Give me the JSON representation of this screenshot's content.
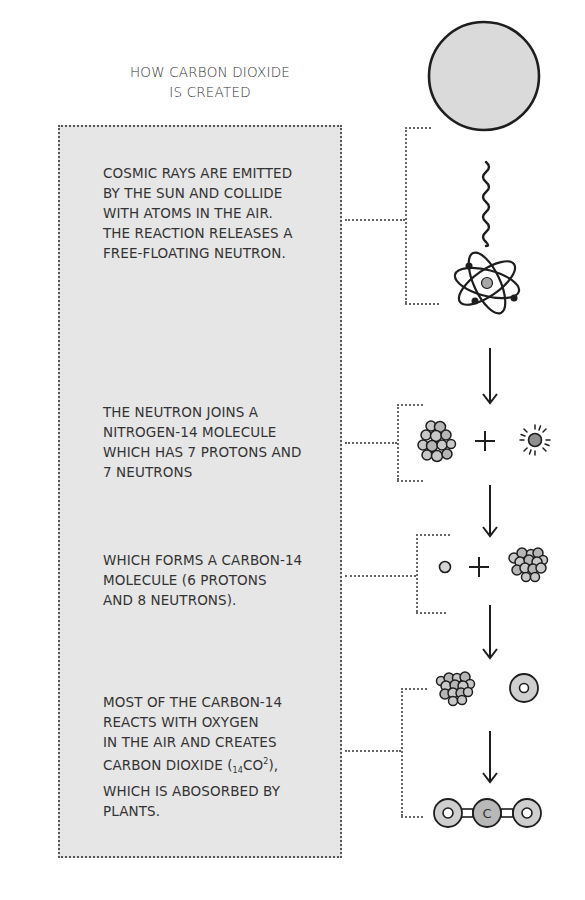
{
  "title": {
    "line1": "HOW CARBON DIOXIDE",
    "line2": "IS CREATED"
  },
  "steps": [
    {
      "lines": [
        "COSMIC RAYS ARE EMITTED",
        "BY THE SUN AND COLLIDE",
        "WITH ATOMS IN THE AIR.",
        "THE REACTION RELEASES A",
        "FREE-FLOATING NEUTRON."
      ],
      "icons": [
        "sun-icon",
        "cosmic-ray-wave-icon",
        "atom-icon"
      ]
    },
    {
      "lines": [
        "THE NEUTRON JOINS A",
        "NITROGEN-14 MOLECULE",
        "WHICH HAS 7 PROTONS AND",
        "7 NEUTRONS"
      ],
      "icons": [
        "nitrogen-nucleus-icon",
        "plus-icon",
        "neutron-icon"
      ]
    },
    {
      "lines": [
        "WHICH FORMS A CARBON-14",
        "MOLECULE (6 PROTONS",
        "AND 8 NEUTRONS)."
      ],
      "icons": [
        "proton-icon",
        "plus-icon",
        "carbon-14-nucleus-icon"
      ]
    },
    {
      "lines": [
        "MOST OF THE CARBON-14",
        "REACTS WITH OXYGEN",
        "IN THE AIR AND CREATES",
        "CARBON DIOXIDE (",
        "WHICH IS ABOSORBED BY",
        "PLANTS."
      ],
      "formula": {
        "subscript": "14",
        "base": "CO",
        "superscript": "2",
        "suffix": "),"
      },
      "icons": [
        "carbon-14-nucleus-icon",
        "oxygen-atom-icon",
        "carbon-dioxide-molecule-icon"
      ]
    }
  ],
  "molecule": {
    "left_label": "O",
    "center_label": "C",
    "right_label": "O"
  },
  "colors": {
    "panel_bg": "#e6e6e6",
    "ink": "#222222",
    "sun_fill": "#dadada",
    "particle_fill": "#c8c8c8",
    "neutron_fill": "#8f8f8f"
  }
}
